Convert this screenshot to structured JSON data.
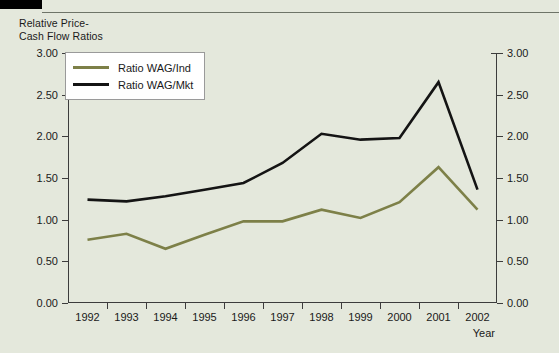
{
  "figure": {
    "background_color": "#e4e8dc",
    "corner_bar_color": "#000000",
    "rule_color": "#6e7468"
  },
  "axis_caption": "Relative Price-\nCash Flow Ratios",
  "legend": {
    "entries": [
      {
        "label": "Ratio WAG/Ind",
        "color": "#7d8048"
      },
      {
        "label": "Ratio WAG/Mkt",
        "color": "#141414"
      }
    ]
  },
  "y_axis": {
    "left_ticks": [
      "3.00",
      "2.50",
      "2.00",
      "1.50",
      "1.00",
      "0.50",
      "0.00"
    ],
    "right_ticks": [
      "3.00",
      "2.50",
      "2.00",
      "1.50",
      "1.00",
      "0.50",
      "0.00"
    ]
  },
  "x_axis": {
    "label": "Year",
    "ticks": [
      "1992",
      "1993",
      "1994",
      "1995",
      "1996",
      "1997",
      "1998",
      "1999",
      "2000",
      "2001",
      "2002"
    ]
  },
  "chart_data": {
    "type": "line",
    "xlabel": "Year",
    "ylabel": "Relative Price-Cash Flow Ratios",
    "x": [
      1992,
      1993,
      1994,
      1995,
      1996,
      1997,
      1998,
      1999,
      2000,
      2001,
      2002
    ],
    "categories": [
      "1992",
      "1993",
      "1994",
      "1995",
      "1996",
      "1997",
      "1998",
      "1999",
      "2000",
      "2001",
      "2002"
    ],
    "ylim": [
      0.0,
      3.0
    ],
    "ytick_step": 0.5,
    "yticks": [
      0.0,
      0.5,
      1.0,
      1.5,
      2.0,
      2.5,
      3.0
    ],
    "grid": false,
    "legend_position": "upper-left",
    "dual_y_axis": true,
    "series": [
      {
        "name": "Ratio WAG/Ind",
        "color": "#7d8048",
        "values": [
          0.76,
          0.83,
          0.65,
          0.82,
          0.98,
          0.98,
          1.12,
          1.02,
          1.21,
          1.63,
          1.12
        ]
      },
      {
        "name": "Ratio WAG/Mkt",
        "color": "#141414",
        "values": [
          1.24,
          1.22,
          1.28,
          1.36,
          1.44,
          1.68,
          2.03,
          1.96,
          1.98,
          2.65,
          1.36
        ]
      }
    ]
  }
}
